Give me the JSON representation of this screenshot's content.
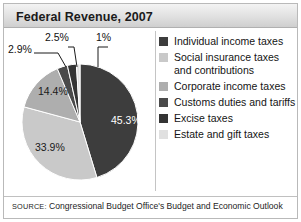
{
  "card": {
    "title": "Federal Revenue, 2007",
    "source_prefix": "SOURCE:",
    "source_text": " Congressional Budget Office's Budget and Economic Outlook"
  },
  "colors": {
    "slice_individual": "#3d3d3d",
    "slice_social": "#c9c9c9",
    "slice_corporate": "#aeaeae",
    "slice_customs": "#4a4a4a",
    "slice_excise": "#343434",
    "slice_estate": "#e0e0e0",
    "title_text": "#1b1b1b",
    "border": "#b9b9b9"
  },
  "legend": {
    "items": [
      {
        "label": "Individual income taxes",
        "swatch": "#3d3d3d"
      },
      {
        "label": "Social insurance taxes and contributions",
        "swatch": "#c9c9c9"
      },
      {
        "label": "Corporate income taxes",
        "swatch": "#aeaeae"
      },
      {
        "label": "Customs duties and tariffs",
        "swatch": "#4a4a4a"
      },
      {
        "label": "Excise taxes",
        "swatch": "#343434"
      },
      {
        "label": "Estate and gift taxes",
        "swatch": "#e0e0e0"
      }
    ]
  },
  "labels": {
    "p453": "45.3%",
    "p339": "33.9%",
    "p144": "14.4%",
    "p29": "2.9%",
    "p25": "2.5%",
    "p1": "1%"
  },
  "chart_data": {
    "type": "pie",
    "title": "Federal Revenue, 2007",
    "subtitle": "",
    "xlabel": "",
    "ylabel": "",
    "legend_position": "right",
    "grid": false,
    "start_angle_deg": 0,
    "direction": "clockwise",
    "units": "percent",
    "categories": [
      "Individual income taxes",
      "Social insurance taxes and contributions",
      "Corporate income taxes",
      "Customs duties and tariffs",
      "Excise taxes",
      "Estate and gift taxes"
    ],
    "values": [
      45.3,
      33.9,
      14.4,
      2.9,
      2.5,
      1.0
    ],
    "value_labels": [
      "45.3%",
      "33.9%",
      "14.4%",
      "2.9%",
      "2.5%",
      "1%"
    ],
    "slice_colors": [
      "#3d3d3d",
      "#c9c9c9",
      "#aeaeae",
      "#4a4a4a",
      "#343434",
      "#e0e0e0"
    ],
    "annotations": [
      "SOURCE: Congressional Budget Office's Budget and Economic Outlook"
    ]
  }
}
